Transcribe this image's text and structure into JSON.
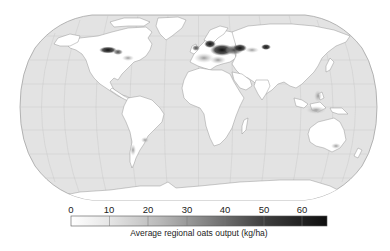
{
  "figure": {
    "type": "choropleth-world-map",
    "projection": "Robinson",
    "ocean_color": "#e3e3e3",
    "land_color": "#ffffff"
  },
  "colorbar": {
    "label": "Average regional oats output (kg/ha)",
    "ticks": [
      "0",
      "10",
      "20",
      "30",
      "40",
      "50",
      "60"
    ],
    "range": [
      0,
      65
    ],
    "colors": {
      "low": "#ffffff",
      "high": "#111111"
    }
  },
  "hotspots": [
    {
      "region": "Northern Great Plains / Canadian Prairies",
      "level": "high"
    },
    {
      "region": "Northern Europe / Scandinavia",
      "level": "high"
    },
    {
      "region": "Eastern Europe / Western Russia",
      "level": "high"
    },
    {
      "region": "Southern Siberia / Kazakhstan",
      "level": "high"
    },
    {
      "region": "Southeast Asia islands",
      "level": "low-moderate"
    },
    {
      "region": "Southern South America",
      "level": "low"
    },
    {
      "region": "Southeast Australia",
      "level": "low"
    }
  ]
}
